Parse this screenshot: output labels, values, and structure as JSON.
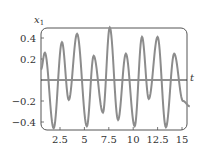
{
  "chart_data": {
    "type": "line",
    "title": "",
    "xlabel": "t",
    "ylabel": "x1",
    "ylabel_main": "x",
    "ylabel_sub": "1",
    "xlim": [
      0.5,
      15.8
    ],
    "ylim": [
      -0.5,
      0.52
    ],
    "grid": false,
    "legend": null,
    "x_ticks": [
      2.5,
      5,
      7.5,
      10,
      12.5,
      15
    ],
    "x_tick_labels": [
      "2.5",
      "5",
      "7.5",
      "10",
      "12.5",
      "15"
    ],
    "y_ticks": [
      0.4,
      0.2,
      -0.2,
      -0.4
    ],
    "y_tick_labels": [
      "0.4",
      "0.2",
      "−0.2",
      "−0.4"
    ],
    "series": [
      {
        "name": "x1(t)",
        "color": "#8c8c8c",
        "x": [
          0.55,
          0.95,
          1.85,
          2.7,
          3.4,
          4.25,
          5.25,
          5.95,
          6.9,
          7.6,
          8.45,
          9.25,
          10.15,
          10.9,
          11.6,
          12.5,
          13.35,
          14.2,
          15.1,
          15.8
        ],
        "y": [
          0.1,
          0.26,
          -0.46,
          0.36,
          -0.19,
          0.44,
          -0.44,
          0.23,
          -0.31,
          0.5,
          -0.38,
          0.25,
          -0.44,
          0.41,
          -0.18,
          0.41,
          -0.45,
          0.25,
          -0.2,
          -0.25
        ]
      }
    ]
  },
  "labels": {
    "y_axis_main": "x",
    "y_axis_sub": "1",
    "x_axis": "t"
  }
}
